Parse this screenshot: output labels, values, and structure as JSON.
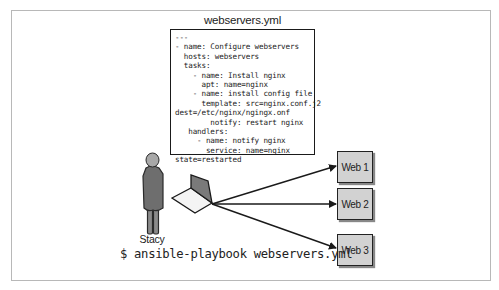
{
  "diagram": {
    "file": {
      "title": "webservers.yml",
      "lines": [
        "---",
        "- name: Configure webservers",
        "  hosts: webservers",
        "  tasks:",
        "    - name: Install nginx",
        "      apt: name=nginx",
        "    - name: install config file",
        "      template: src=nginx.conf.j2",
        "dest=/etc/nginx/ngingx.onf",
        "        notify: restart nginx",
        "   handlers:",
        "     - name: notify nginx",
        "       service: name=nginx",
        "state=restarted"
      ]
    },
    "person": {
      "label": "Stacy"
    },
    "command": "$ ansible-playbook webservers.yml",
    "servers": [
      {
        "label": "Web 1"
      },
      {
        "label": "Web 2"
      },
      {
        "label": "Web 3"
      }
    ],
    "colors": {
      "person_fill": "#6e6e6e",
      "person_head": "#a8a8a8",
      "server_fill": "#d2d2d2",
      "laptop_screen": "#7a7a7a",
      "stroke": "#1a1a1a",
      "frame_border": "#b8b8b8"
    }
  }
}
